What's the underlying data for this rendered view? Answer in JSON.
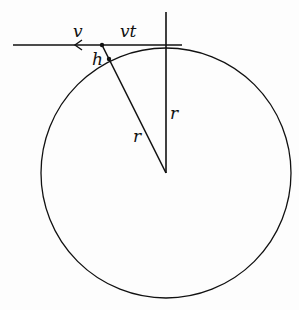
{
  "diagram": {
    "type": "geometry",
    "labels": {
      "velocity": "v",
      "distance": "vt",
      "height": "h",
      "radius_slant": "r",
      "radius_vertical": "r"
    },
    "colors": {
      "stroke": "#111111",
      "background": "#fdfdfd"
    }
  }
}
